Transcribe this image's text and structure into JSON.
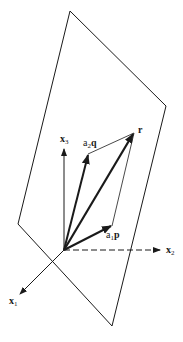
{
  "diagram": {
    "type": "vector-plane-decomposition",
    "colors": {
      "stroke": "#1a1a1a",
      "background": "#ffffff"
    },
    "plane": {
      "vertices": [
        [
          70,
          11
        ],
        [
          166,
          106
        ],
        [
          112,
          326
        ],
        [
          18,
          224
        ]
      ]
    },
    "origin": [
      64,
      250
    ],
    "axes": {
      "x1": {
        "label_base": "x",
        "label_sub": "1",
        "tip": [
          20,
          294
        ],
        "style": "solid"
      },
      "x2": {
        "label_base": "x",
        "label_sub": "2",
        "tip": [
          160,
          250
        ],
        "style": "dashed"
      },
      "x3": {
        "label_base": "x",
        "label_sub": "3",
        "tip": [
          64,
          148
        ],
        "style": "solid"
      }
    },
    "vectors": {
      "r": {
        "label": "r",
        "tip": [
          134,
          133
        ]
      },
      "a2q": {
        "label_coef": "a",
        "label_sub": "2",
        "label_vec": "q",
        "tip": [
          88,
          154
        ]
      },
      "a1p": {
        "label_coef": "a",
        "label_sub": "1",
        "label_vec": "p",
        "tip": [
          112,
          226
        ]
      }
    }
  }
}
